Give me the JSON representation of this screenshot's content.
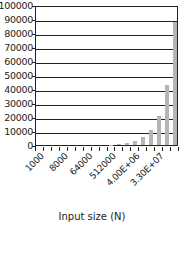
{
  "chart_data": {
    "type": "bar",
    "title": "",
    "xlabel": "Input size (N)",
    "ylabel": "",
    "ylim": [
      0,
      100000
    ],
    "yticks": [
      "0",
      "10000",
      "20000",
      "30000",
      "40000",
      "50000",
      "60000",
      "70000",
      "80000",
      "90000",
      "100000"
    ],
    "categories": [
      "1000",
      "2000",
      "4000",
      "8000",
      "16000",
      "32000",
      "64000",
      "128000",
      "256000",
      "512000",
      "1.02E+06",
      "2.05E+06",
      "4.00E+06",
      "8.19E+06",
      "1.64E+07",
      "3.30E+07",
      "6.55E+07",
      "1.31E+08"
    ],
    "xtick_labels_shown": [
      "1000",
      "8000",
      "64000",
      "512000",
      "4.00E+06",
      "3.30E+07"
    ],
    "values": [
      0,
      0,
      0,
      0,
      0,
      0,
      0,
      0,
      0,
      350,
      700,
      1400,
      2700,
      5500,
      11000,
      21000,
      43000,
      88000
    ],
    "bar_color": "#b5b5b5",
    "grid": true,
    "legend": null
  }
}
